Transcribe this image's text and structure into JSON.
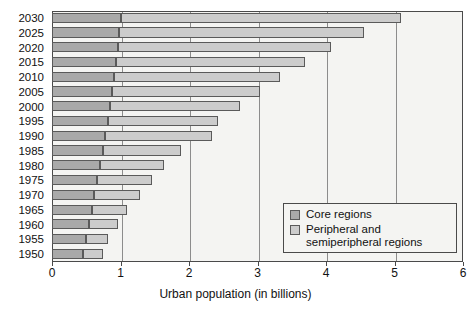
{
  "chart_data": {
    "type": "bar",
    "orientation": "horizontal",
    "stacked": true,
    "title": "",
    "xlabel": "Urban population (in billions)",
    "ylabel": "",
    "xlim": [
      0,
      6
    ],
    "xticks": [
      0,
      1,
      2,
      3,
      4,
      5,
      6
    ],
    "xtick_labels": [
      "0",
      "1",
      "2",
      "3",
      "4",
      "5",
      "6"
    ],
    "grid": "vertical",
    "legend_position": "lower-right-inside",
    "categories": [
      "2030",
      "2025",
      "2020",
      "2015",
      "2010",
      "2005",
      "2000",
      "1995",
      "1990",
      "1985",
      "1980",
      "1975",
      "1970",
      "1965",
      "1960",
      "1955",
      "1950"
    ],
    "series": [
      {
        "name": "Core regions",
        "color": "#a9a9a9",
        "values": [
          1.0,
          0.98,
          0.96,
          0.94,
          0.91,
          0.88,
          0.85,
          0.82,
          0.78,
          0.74,
          0.7,
          0.66,
          0.62,
          0.58,
          0.54,
          0.5,
          0.45
        ]
      },
      {
        "name": "Peripheral and\nsemiperipheral regions",
        "color": "#cccccc",
        "values": [
          4.1,
          3.57,
          3.11,
          2.75,
          2.42,
          2.15,
          1.89,
          1.6,
          1.56,
          1.15,
          0.93,
          0.8,
          0.67,
          0.52,
          0.42,
          0.32,
          0.3
        ]
      }
    ],
    "totals": [
      5.1,
      4.55,
      4.07,
      3.69,
      3.33,
      3.03,
      2.74,
      2.42,
      2.34,
      1.89,
      1.63,
      1.46,
      1.29,
      1.1,
      0.96,
      0.82,
      0.75
    ]
  },
  "legend": {
    "items": [
      {
        "label": "Core regions",
        "swatch": "core-swatch"
      },
      {
        "label": "Peripheral and\nsemiperipheral regions",
        "swatch": "peripheral-swatch"
      }
    ]
  },
  "axis": {
    "x_title": "Urban population (in billions)"
  }
}
